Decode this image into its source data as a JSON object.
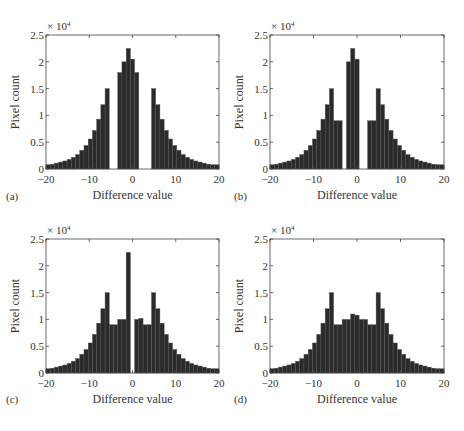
{
  "figure": {
    "panels": [
      {
        "letter": "(a)",
        "xlabel": "Difference value",
        "ylabel": "Pixel count",
        "multiplier": "× 10",
        "multiplier_exp": "4"
      },
      {
        "letter": "(b)",
        "xlabel": "Difference value",
        "ylabel": "Pixel count",
        "multiplier": "× 10",
        "multiplier_exp": "4"
      },
      {
        "letter": "(c)",
        "xlabel": "Difference value",
        "ylabel": "Pixel count",
        "multiplier": "× 10",
        "multiplier_exp": "4"
      },
      {
        "letter": "(d)",
        "xlabel": "Difference value",
        "ylabel": "Pixel count",
        "multiplier": "× 10",
        "multiplier_exp": "4"
      }
    ],
    "xticks": [
      "-20",
      "-10",
      "0",
      "10",
      "20"
    ],
    "yticks": [
      "0",
      "0.5",
      "1",
      "1.5",
      "2",
      "2.5"
    ],
    "bar_color": "#2b2b2b"
  },
  "chart_data": [
    {
      "panel": "(a)",
      "type": "bar",
      "title": "",
      "xlabel": "Difference value",
      "ylabel": "Pixel count",
      "y_scale_note": "× 10^4",
      "xlim": [
        -20,
        20
      ],
      "ylim": [
        0,
        2.5
      ],
      "grid": false,
      "x": [
        -20,
        -19,
        -18,
        -17,
        -16,
        -15,
        -14,
        -13,
        -12,
        -11,
        -10,
        -9,
        -8,
        -7,
        -6,
        -5,
        -4,
        -3,
        -2,
        -1,
        0,
        1,
        2,
        3,
        4,
        5,
        6,
        7,
        8,
        9,
        10,
        11,
        12,
        13,
        14,
        15,
        16,
        17,
        18,
        19,
        20
      ],
      "values": [
        0.08,
        0.09,
        0.11,
        0.13,
        0.15,
        0.18,
        0.22,
        0.27,
        0.35,
        0.44,
        0.56,
        0.72,
        0.93,
        1.2,
        1.5,
        0,
        0,
        1.8,
        2.0,
        2.25,
        2.05,
        1.8,
        0,
        0,
        0,
        1.5,
        1.2,
        0.93,
        0.72,
        0.56,
        0.44,
        0.35,
        0.27,
        0.22,
        0.18,
        0.15,
        0.13,
        0.11,
        0.09,
        0.08,
        0.08
      ]
    },
    {
      "panel": "(b)",
      "type": "bar",
      "title": "",
      "xlabel": "Difference value",
      "ylabel": "Pixel count",
      "y_scale_note": "× 10^4",
      "xlim": [
        -20,
        20
      ],
      "ylim": [
        0,
        2.5
      ],
      "grid": false,
      "x": [
        -20,
        -19,
        -18,
        -17,
        -16,
        -15,
        -14,
        -13,
        -12,
        -11,
        -10,
        -9,
        -8,
        -7,
        -6,
        -5,
        -4,
        -3,
        -2,
        -1,
        0,
        1,
        2,
        3,
        4,
        5,
        6,
        7,
        8,
        9,
        10,
        11,
        12,
        13,
        14,
        15,
        16,
        17,
        18,
        19,
        20
      ],
      "values": [
        0.08,
        0.09,
        0.11,
        0.13,
        0.15,
        0.18,
        0.22,
        0.27,
        0.35,
        0.44,
        0.56,
        0.72,
        0.93,
        1.2,
        1.5,
        0.9,
        0.9,
        0,
        2.0,
        2.25,
        2.05,
        0,
        0,
        0.9,
        0.9,
        1.5,
        1.2,
        0.93,
        0.72,
        0.56,
        0.44,
        0.35,
        0.27,
        0.22,
        0.18,
        0.15,
        0.13,
        0.11,
        0.09,
        0.08,
        0.08
      ]
    },
    {
      "panel": "(c)",
      "type": "bar",
      "title": "",
      "xlabel": "Difference value",
      "ylabel": "Pixel count",
      "y_scale_note": "× 10^4",
      "xlim": [
        -20,
        20
      ],
      "ylim": [
        0,
        2.5
      ],
      "grid": false,
      "x": [
        -20,
        -19,
        -18,
        -17,
        -16,
        -15,
        -14,
        -13,
        -12,
        -11,
        -10,
        -9,
        -8,
        -7,
        -6,
        -5,
        -4,
        -3,
        -2,
        -1,
        0,
        1,
        2,
        3,
        4,
        5,
        6,
        7,
        8,
        9,
        10,
        11,
        12,
        13,
        14,
        15,
        16,
        17,
        18,
        19,
        20
      ],
      "values": [
        0.08,
        0.09,
        0.11,
        0.13,
        0.15,
        0.18,
        0.22,
        0.27,
        0.35,
        0.44,
        0.56,
        0.72,
        0.93,
        1.2,
        1.5,
        0.9,
        0.9,
        1.0,
        1.0,
        2.25,
        0,
        1.0,
        1.02,
        0.9,
        0.9,
        1.5,
        1.2,
        0.93,
        0.72,
        0.56,
        0.44,
        0.35,
        0.27,
        0.22,
        0.18,
        0.15,
        0.13,
        0.11,
        0.09,
        0.08,
        0.08
      ]
    },
    {
      "panel": "(d)",
      "type": "bar",
      "title": "",
      "xlabel": "Difference value",
      "ylabel": "Pixel count",
      "y_scale_note": "× 10^4",
      "xlim": [
        -20,
        20
      ],
      "ylim": [
        0,
        2.5
      ],
      "grid": false,
      "x": [
        -20,
        -19,
        -18,
        -17,
        -16,
        -15,
        -14,
        -13,
        -12,
        -11,
        -10,
        -9,
        -8,
        -7,
        -6,
        -5,
        -4,
        -3,
        -2,
        -1,
        0,
        1,
        2,
        3,
        4,
        5,
        6,
        7,
        8,
        9,
        10,
        11,
        12,
        13,
        14,
        15,
        16,
        17,
        18,
        19,
        20
      ],
      "values": [
        0.08,
        0.09,
        0.11,
        0.13,
        0.15,
        0.18,
        0.22,
        0.27,
        0.35,
        0.44,
        0.56,
        0.72,
        0.93,
        1.2,
        1.5,
        0.9,
        0.9,
        1.0,
        1.0,
        1.1,
        1.08,
        1.0,
        1.0,
        0.9,
        0.9,
        1.5,
        1.2,
        0.93,
        0.72,
        0.56,
        0.44,
        0.35,
        0.27,
        0.22,
        0.18,
        0.15,
        0.13,
        0.11,
        0.09,
        0.08,
        0.08
      ]
    }
  ]
}
